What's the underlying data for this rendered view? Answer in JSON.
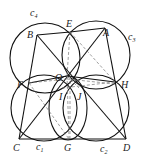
{
  "figure": {
    "points": [
      {
        "name": "A",
        "x": 105,
        "y": 28,
        "lx": 104,
        "ly": 36
      },
      {
        "name": "B",
        "x": 37,
        "y": 35,
        "lx": 27,
        "ly": 38
      },
      {
        "name": "E",
        "x": 70,
        "y": 32,
        "lx": 66,
        "ly": 26
      },
      {
        "name": "O",
        "x": 67,
        "y": 76,
        "lx": 55,
        "ly": 78
      },
      {
        "name": "F",
        "x": 29,
        "y": 83,
        "lx": 18,
        "ly": 87
      },
      {
        "name": "H",
        "x": 115,
        "y": 82,
        "lx": 121,
        "ly": 87
      },
      {
        "name": "I",
        "x": 62,
        "y": 88,
        "lx": 59,
        "ly": 99
      },
      {
        "name": "J",
        "x": 79,
        "y": 88,
        "lx": 76,
        "ly": 99
      },
      {
        "name": "C",
        "x": 19,
        "y": 139,
        "lx": 13,
        "ly": 152
      },
      {
        "name": "G",
        "x": 69,
        "y": 139,
        "lx": 64,
        "ly": 152
      },
      {
        "name": "D",
        "x": 126,
        "y": 139,
        "lx": 124,
        "ly": 152
      }
    ],
    "circles": [
      {
        "name": "c4",
        "label": "c",
        "sub": "4",
        "cx": 45,
        "cy": 58,
        "r": 35,
        "lx": 30,
        "ly": 15
      },
      {
        "name": "c3",
        "label": "c",
        "sub": "3",
        "cx": 96,
        "cy": 55,
        "r": 34,
        "lx": 128,
        "ly": 40
      },
      {
        "name": "c1",
        "label": "c",
        "sub": "1",
        "cx": 44,
        "cy": 108,
        "r": 33,
        "lx": 37,
        "ly": 150
      },
      {
        "name": "c2",
        "label": "c",
        "sub": "2",
        "cx": 96,
        "cy": 108,
        "r": 33,
        "lx": 100,
        "ly": 152
      },
      {
        "name": "c5",
        "label": "",
        "sub": "",
        "cx": 68,
        "cy": 107,
        "r": 0,
        "lx": 0,
        "ly": 0
      }
    ]
  }
}
